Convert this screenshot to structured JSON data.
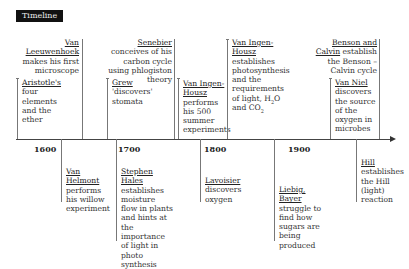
{
  "header": {
    "title": "Timeline"
  },
  "years": [
    "1600",
    "1700",
    "1800",
    "1900"
  ],
  "events_above": [
    {
      "name": "Van Leeuwenhoek",
      "text": "makes his first microscope"
    },
    {
      "name": "Aristotle's",
      "text": "four elements and the ether"
    },
    {
      "name": "Senebier",
      "text": "conceives of his carbon cycle using phlogiston theory"
    },
    {
      "name": "Grew",
      "text": "'discovers' stomata"
    },
    {
      "name": "Van Ingen-Housz",
      "text": "performs his 500 summer experiments"
    },
    {
      "name": "Van Ingen-Housz",
      "text": "establishes photosynthesis and the requirements of light, H",
      "sub1": "2",
      "text2": "O and CO",
      "sub2": "2"
    },
    {
      "name": "Benson and Calvin",
      "text": "establish the Benson –Calvin cycle"
    },
    {
      "name": "Van Niel",
      "text": "discovers the source of the oxygen in microbes"
    }
  ],
  "events_below": [
    {
      "name": "Van Helmont",
      "text": "performs his willow experiment"
    },
    {
      "name": "Stephen Hales",
      "text": "establishes moisture flow in plants and hints at the importance of light in photo synthesis"
    },
    {
      "name": "Lavoisier",
      "text": "discovers oxygen"
    },
    {
      "name": "Liebig, Bayer",
      "text": "struggle to find how sugars are being produced"
    },
    {
      "name": "Hill",
      "text": "establishes the Hill (light) reaction"
    }
  ]
}
